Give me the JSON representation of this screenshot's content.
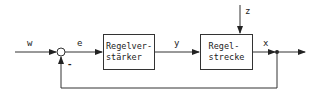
{
  "diagram": {
    "type": "control-loop block diagram",
    "signals": {
      "w": "w",
      "e": "e",
      "y": "y",
      "z": "z",
      "x": "x",
      "minus": "-"
    },
    "blocks": [
      {
        "id": "controller",
        "label": "Regelver-\nstärker"
      },
      {
        "id": "plant",
        "label": "Regel-\nstrecke"
      }
    ],
    "colors": {
      "line": "#333333",
      "background": "#ffffff"
    }
  }
}
